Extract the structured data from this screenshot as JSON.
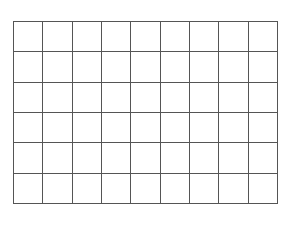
{
  "grid": {
    "rows": 6,
    "columns": 9,
    "line_color": "#555555",
    "background_color": "#ffffff",
    "cells": []
  }
}
